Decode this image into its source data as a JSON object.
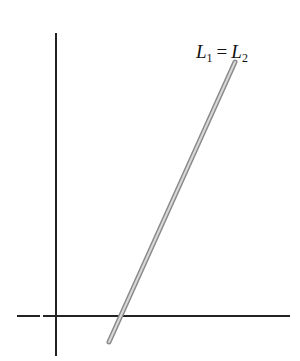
{
  "diagram": {
    "line_label": {
      "left": "L",
      "left_sub": "1",
      "operator": "=",
      "right": "L",
      "right_sub": "2"
    },
    "colors": {
      "axis": "#222222",
      "line_outer": "#8a8a8a",
      "line_inner": "#d8d8d8",
      "background": "#ffffff"
    },
    "axes": {
      "vertical": {
        "x": 56,
        "y1": 33,
        "y2": 356
      },
      "horizontal": {
        "y": 316,
        "segments": [
          [
            17,
            40
          ],
          [
            43,
            290
          ]
        ]
      }
    },
    "line": {
      "x1": 109,
      "y1": 342,
      "x2": 235,
      "y2": 62
    }
  }
}
